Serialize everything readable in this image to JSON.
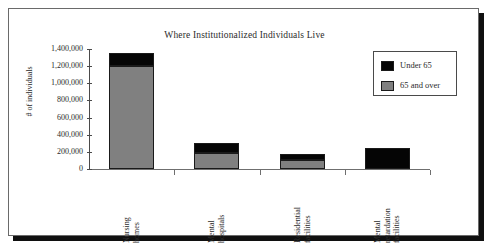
{
  "chart_data": {
    "type": "bar",
    "stacked": true,
    "title": "Where Institutionalized Individuals Live",
    "xlabel": "",
    "ylabel": "# of individuals",
    "categories": [
      "Nursing homes",
      "Mental hospitals",
      "Residential facilities",
      "Mental retardation facilities"
    ],
    "category_lines": [
      [
        "Nursing",
        "homes"
      ],
      [
        "Mental",
        "hospitals"
      ],
      [
        "Residential",
        "facilities"
      ],
      [
        "Mental",
        "retardation",
        "facilities"
      ]
    ],
    "series": [
      {
        "name": "65 and over",
        "color": "#808080",
        "values": [
          1200000,
          190000,
          100000,
          0
        ]
      },
      {
        "name": "Under 65",
        "color": "#050505",
        "values": [
          150000,
          110000,
          80000,
          250000
        ]
      }
    ],
    "totals": [
      1350000,
      300000,
      180000,
      250000
    ],
    "ylim": [
      0,
      1400000
    ],
    "ytick_values": [
      0,
      200000,
      400000,
      600000,
      800000,
      1000000,
      1200000,
      1400000
    ],
    "ytick_labels": [
      "0",
      "200,000",
      "400,000",
      "600,000",
      "800,000",
      "1,000,000",
      "1,200,000",
      "1,400,000"
    ],
    "grid": false,
    "legend_position": "upper right",
    "legend_entries": [
      {
        "label": "Under 65",
        "color": "#050505"
      },
      {
        "label": "65 and over",
        "color": "#808080"
      }
    ]
  }
}
